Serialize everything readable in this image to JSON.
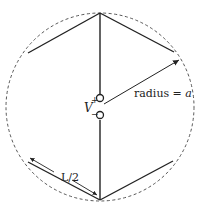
{
  "diagram": {
    "type": "bent dipole antenna in circle",
    "labels": {
      "radius_text": "radius = ",
      "radius_var": "a",
      "voltage": "V",
      "plus": "+",
      "minus": "−",
      "half_length": "L/2"
    },
    "colors": {
      "line": "#222222",
      "circle": "#444444",
      "background": "#ffffff"
    }
  }
}
